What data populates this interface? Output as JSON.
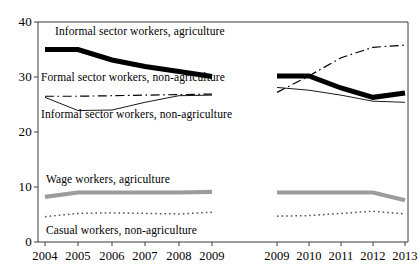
{
  "chart_data": {
    "type": "line",
    "title": "",
    "xlabel": "",
    "ylabel": "",
    "ylim": [
      0,
      40
    ],
    "yticks": [
      0,
      10,
      20,
      30,
      40
    ],
    "grid": false,
    "legend_position": "inline-annotations",
    "panels": [
      {
        "name": "panel-left",
        "x": [
          "2004",
          "2005",
          "2006",
          "2007",
          "2008",
          "2009"
        ],
        "series": [
          {
            "name": "Informal sector workers, agriculture",
            "style": "thick-solid-black",
            "color": "#000000",
            "values": [
              35.0,
              35.0,
              33.1,
              31.9,
              31.0,
              30.1
            ]
          },
          {
            "name": "Formal sector workers, non-agriculture",
            "style": "dash-dot-black",
            "color": "#000000",
            "values": [
              26.5,
              26.5,
              26.6,
              26.7,
              26.8,
              26.9
            ]
          },
          {
            "name": "Informal sector workers, non-agriculture",
            "style": "thin-solid-black",
            "color": "#000000",
            "values": [
              26.3,
              23.9,
              24.0,
              25.4,
              26.6,
              26.7
            ]
          },
          {
            "name": "Wage workers, agriculture",
            "style": "thick-solid-gray",
            "color": "#9c9c9c",
            "values": [
              8.2,
              9.0,
              9.0,
              9.0,
              9.0,
              9.1
            ]
          },
          {
            "name": "Casual workers, non-agriculture",
            "style": "dotted-gray",
            "color": "#555555",
            "values": [
              4.6,
              5.2,
              5.3,
              5.2,
              5.1,
              5.4
            ]
          }
        ]
      },
      {
        "name": "panel-right",
        "x": [
          "2009",
          "2010",
          "2011",
          "2012",
          "2013"
        ],
        "series": [
          {
            "name": "Informal sector workers, agriculture",
            "style": "thick-solid-black",
            "color": "#000000",
            "values": [
              30.2,
              30.2,
              28.0,
              26.3,
              27.1
            ]
          },
          {
            "name": "Formal sector workers, non-agriculture",
            "style": "dash-dot-black",
            "color": "#000000",
            "values": [
              27.2,
              30.2,
              33.5,
              35.4,
              35.8
            ]
          },
          {
            "name": "Informal sector workers, non-agriculture",
            "style": "thin-solid-black",
            "color": "#000000",
            "values": [
              28.1,
              27.6,
              26.7,
              25.6,
              25.4
            ]
          },
          {
            "name": "Wage workers, agriculture",
            "style": "thick-solid-gray",
            "color": "#9c9c9c",
            "values": [
              9.0,
              9.0,
              9.0,
              9.0,
              7.6
            ]
          },
          {
            "name": "Casual workers, non-agriculture",
            "style": "dotted-gray",
            "color": "#555555",
            "values": [
              4.7,
              4.8,
              5.2,
              5.6,
              5.1
            ]
          }
        ]
      }
    ],
    "annotations": [
      {
        "text": "Informal sector workers, agriculture",
        "x": 55,
        "y": 25
      },
      {
        "text": "Formal sector workers, non-agriculture",
        "x": 41,
        "y": 71
      },
      {
        "text": "Informal sector workers, non-agriculture",
        "x": 41,
        "y": 108
      },
      {
        "text": "Wage workers, agriculture",
        "x": 46,
        "y": 173
      },
      {
        "text": "Casual workers, non-agriculture",
        "x": 46,
        "y": 224
      }
    ]
  },
  "axes": {
    "y_ticks": [
      {
        "label": "40",
        "value": 40
      },
      {
        "label": "30",
        "value": 30
      },
      {
        "label": "20",
        "value": 20
      },
      {
        "label": "10",
        "value": 10
      },
      {
        "label": "0",
        "value": 0
      }
    ],
    "x_ticks_left": [
      "2004",
      "2005",
      "2006",
      "2007",
      "2008",
      "2009"
    ],
    "x_ticks_right": [
      "2009",
      "2010",
      "2011",
      "2012",
      "2013"
    ]
  }
}
